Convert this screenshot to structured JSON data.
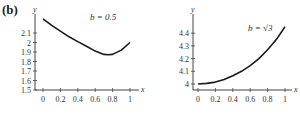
{
  "figure": {
    "panel_label": "(b)"
  },
  "chart_data": [
    {
      "type": "line",
      "title": "",
      "annotation": "b = 0.5",
      "xlabel": "x",
      "ylabel": "y",
      "xlim": [
        0,
        1
      ],
      "ylim": [
        1.5,
        2.25
      ],
      "xticks": [
        "0",
        "0.2",
        "0.4",
        "0.6",
        "0.8",
        "1"
      ],
      "yticks": [
        "1.5",
        "1.6",
        "1.7",
        "1.8",
        "1.9",
        "2",
        "2.1"
      ],
      "grid": false,
      "x": [
        0,
        0.1,
        0.2,
        0.3,
        0.4,
        0.5,
        0.6,
        0.7,
        0.75,
        0.8,
        0.9,
        1.0
      ],
      "series": [
        {
          "name": "b = 0.5",
          "values": [
            2.25,
            2.18,
            2.12,
            2.06,
            2.01,
            1.96,
            1.91,
            1.875,
            1.87,
            1.875,
            1.92,
            2.0
          ]
        }
      ]
    },
    {
      "type": "line",
      "title": "",
      "annotation": "b = √3",
      "xlabel": "x",
      "ylabel": "y",
      "xlim": [
        0,
        1
      ],
      "ylim": [
        3.95,
        4.5
      ],
      "xticks": [
        "0",
        "0.2",
        "0.4",
        "0.6",
        "0.8",
        "1"
      ],
      "yticks": [
        "4",
        "4.1",
        "4.2",
        "4.3",
        "4.4"
      ],
      "grid": false,
      "x": [
        0,
        0.1,
        0.2,
        0.3,
        0.4,
        0.5,
        0.6,
        0.7,
        0.8,
        0.9,
        1.0
      ],
      "series": [
        {
          "name": "b = √3",
          "values": [
            4.0,
            4.005,
            4.015,
            4.035,
            4.065,
            4.1,
            4.145,
            4.2,
            4.27,
            4.35,
            4.45
          ]
        }
      ]
    }
  ]
}
